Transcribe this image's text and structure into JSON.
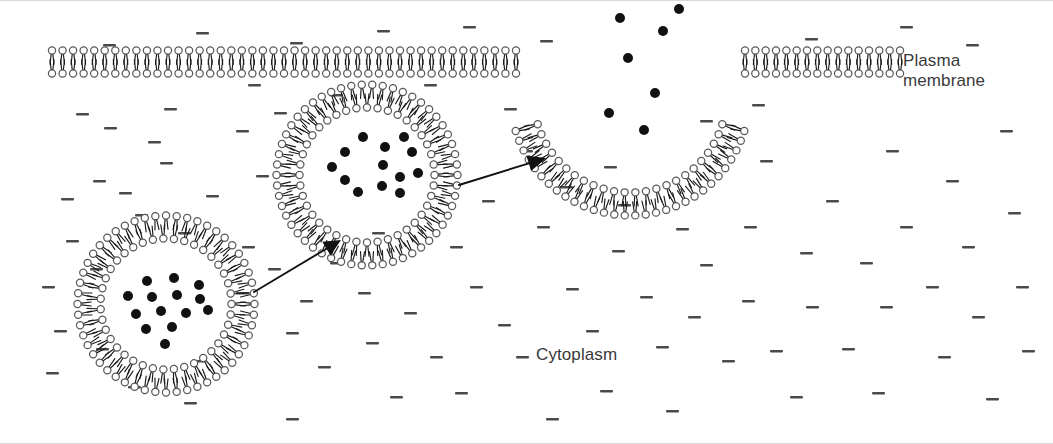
{
  "figure": {
    "type": "cell-biology-diagram",
    "width": 1053,
    "height": 444,
    "background_color": "#ffffff"
  },
  "labels": {
    "plasma_membrane": "Plasma\nmembrane",
    "cytoplasm": "Cytoplasm"
  },
  "colors": {
    "head_stroke": "#5a5a5a",
    "tail_stroke": "#1a1a1a",
    "cargo_fill": "#111111",
    "arrow_stroke": "#111111",
    "dash_fill": "#4a4a4a",
    "text": "#3a3a3a",
    "frame": "#d8d8d8"
  },
  "style": {
    "head_radius": 3.6,
    "head_stroke_width": 1.25,
    "tail_length": 9.5,
    "tail_stroke_width": 1.15,
    "tail_spread": 2.0,
    "lipid_spacing": 10.6,
    "bilayer_gap": 23.0,
    "cargo_radius": 5.0
  },
  "membrane_segments": [
    {
      "name": "plasma-membrane-left",
      "kind": "flat",
      "x1": 52,
      "x2": 516,
      "y": 62,
      "note": "intact bilayer left of the fusion site"
    },
    {
      "name": "plasma-membrane-right",
      "kind": "flat",
      "x1": 745,
      "x2": 900,
      "y": 62,
      "note": "intact bilayer right of the fusion site"
    }
  ],
  "fusion_pore": {
    "name": "fusion-pore",
    "center_x": 630,
    "center_y": 96,
    "radius": 108,
    "start_angle_deg": 163,
    "end_angle_deg": 17,
    "note": "open U-shaped pore continuous with the plasma membrane, releasing cargo"
  },
  "vesicles": [
    {
      "name": "vesicle-cytoplasmic",
      "stage": "free in cytoplasm",
      "center_x": 166,
      "center_y": 304,
      "radius": 77,
      "cargo": [
        {
          "x": 147,
          "y": 281
        },
        {
          "x": 174,
          "y": 278
        },
        {
          "x": 199,
          "y": 285
        },
        {
          "x": 128,
          "y": 296
        },
        {
          "x": 152,
          "y": 297
        },
        {
          "x": 177,
          "y": 295
        },
        {
          "x": 200,
          "y": 299
        },
        {
          "x": 136,
          "y": 314
        },
        {
          "x": 161,
          "y": 311
        },
        {
          "x": 186,
          "y": 313
        },
        {
          "x": 208,
          "y": 310
        },
        {
          "x": 146,
          "y": 329
        },
        {
          "x": 172,
          "y": 327
        },
        {
          "x": 165,
          "y": 344
        }
      ]
    },
    {
      "name": "vesicle-docking",
      "stage": "approaching the plasma membrane",
      "center_x": 367,
      "center_y": 175,
      "radius": 79,
      "cargo": [
        {
          "x": 363,
          "y": 137
        },
        {
          "x": 404,
          "y": 137
        },
        {
          "x": 345,
          "y": 152
        },
        {
          "x": 385,
          "y": 147
        },
        {
          "x": 412,
          "y": 152
        },
        {
          "x": 332,
          "y": 167
        },
        {
          "x": 383,
          "y": 165
        },
        {
          "x": 345,
          "y": 180
        },
        {
          "x": 400,
          "y": 177
        },
        {
          "x": 418,
          "y": 173
        },
        {
          "x": 382,
          "y": 186
        },
        {
          "x": 358,
          "y": 192
        },
        {
          "x": 400,
          "y": 193
        }
      ]
    }
  ],
  "released_cargo": [
    {
      "x": 620,
      "y": 18
    },
    {
      "x": 679,
      "y": 9
    },
    {
      "x": 663,
      "y": 31
    },
    {
      "x": 628,
      "y": 58
    },
    {
      "x": 655,
      "y": 93
    },
    {
      "x": 609,
      "y": 113
    },
    {
      "x": 644,
      "y": 130
    }
  ],
  "arrows": [
    {
      "name": "arrow-vesicle-to-dock",
      "x1": 254,
      "y1": 292,
      "x2": 341,
      "y2": 240,
      "head_length": 17,
      "head_width": 8
    },
    {
      "name": "arrow-dock-to-fusion",
      "x1": 459,
      "y1": 185,
      "x2": 546,
      "y2": 158,
      "head_length": 18,
      "head_width": 8
    }
  ],
  "cytoplasm_dashes": [
    {
      "x": 103,
      "y": 44
    },
    {
      "x": 196,
      "y": 32
    },
    {
      "x": 290,
      "y": 42
    },
    {
      "x": 377,
      "y": 30
    },
    {
      "x": 463,
      "y": 26
    },
    {
      "x": 540,
      "y": 40
    },
    {
      "x": 805,
      "y": 38
    },
    {
      "x": 900,
      "y": 26
    },
    {
      "x": 966,
      "y": 44
    },
    {
      "x": 76,
      "y": 113
    },
    {
      "x": 104,
      "y": 127
    },
    {
      "x": 148,
      "y": 141
    },
    {
      "x": 160,
      "y": 162
    },
    {
      "x": 93,
      "y": 180
    },
    {
      "x": 119,
      "y": 192
    },
    {
      "x": 61,
      "y": 198
    },
    {
      "x": 206,
      "y": 195
    },
    {
      "x": 236,
      "y": 130
    },
    {
      "x": 256,
      "y": 175
    },
    {
      "x": 274,
      "y": 112
    },
    {
      "x": 178,
      "y": 232
    },
    {
      "x": 135,
      "y": 214
    },
    {
      "x": 66,
      "y": 240
    },
    {
      "x": 42,
      "y": 286
    },
    {
      "x": 90,
      "y": 268
    },
    {
      "x": 54,
      "y": 330
    },
    {
      "x": 96,
      "y": 348
    },
    {
      "x": 46,
      "y": 372
    },
    {
      "x": 128,
      "y": 386
    },
    {
      "x": 192,
      "y": 360
    },
    {
      "x": 184,
      "y": 402
    },
    {
      "x": 242,
      "y": 246
    },
    {
      "x": 268,
      "y": 268
    },
    {
      "x": 236,
      "y": 292
    },
    {
      "x": 300,
      "y": 300
    },
    {
      "x": 286,
      "y": 332
    },
    {
      "x": 330,
      "y": 262
    },
    {
      "x": 358,
      "y": 292
    },
    {
      "x": 318,
      "y": 366
    },
    {
      "x": 366,
      "y": 342
    },
    {
      "x": 404,
      "y": 312
    },
    {
      "x": 430,
      "y": 356
    },
    {
      "x": 390,
      "y": 396
    },
    {
      "x": 286,
      "y": 418
    },
    {
      "x": 372,
      "y": 232
    },
    {
      "x": 450,
      "y": 246
    },
    {
      "x": 482,
      "y": 200
    },
    {
      "x": 470,
      "y": 286
    },
    {
      "x": 498,
      "y": 324
    },
    {
      "x": 455,
      "y": 392
    },
    {
      "x": 516,
      "y": 356
    },
    {
      "x": 520,
      "y": 150
    },
    {
      "x": 504,
      "y": 108
    },
    {
      "x": 537,
      "y": 226
    },
    {
      "x": 560,
      "y": 186
    },
    {
      "x": 566,
      "y": 288
    },
    {
      "x": 586,
      "y": 330
    },
    {
      "x": 546,
      "y": 418
    },
    {
      "x": 612,
      "y": 250
    },
    {
      "x": 600,
      "y": 390
    },
    {
      "x": 640,
      "y": 296
    },
    {
      "x": 656,
      "y": 346
    },
    {
      "x": 618,
      "y": 204
    },
    {
      "x": 676,
      "y": 228
    },
    {
      "x": 700,
      "y": 264
    },
    {
      "x": 688,
      "y": 316
    },
    {
      "x": 666,
      "y": 410
    },
    {
      "x": 722,
      "y": 360
    },
    {
      "x": 742,
      "y": 300
    },
    {
      "x": 744,
      "y": 226
    },
    {
      "x": 760,
      "y": 160
    },
    {
      "x": 770,
      "y": 350
    },
    {
      "x": 790,
      "y": 396
    },
    {
      "x": 800,
      "y": 252
    },
    {
      "x": 806,
      "y": 306
    },
    {
      "x": 826,
      "y": 200
    },
    {
      "x": 842,
      "y": 348
    },
    {
      "x": 860,
      "y": 262
    },
    {
      "x": 872,
      "y": 392
    },
    {
      "x": 880,
      "y": 306
    },
    {
      "x": 886,
      "y": 150
    },
    {
      "x": 900,
      "y": 226
    },
    {
      "x": 926,
      "y": 286
    },
    {
      "x": 938,
      "y": 356
    },
    {
      "x": 946,
      "y": 180
    },
    {
      "x": 962,
      "y": 246
    },
    {
      "x": 972,
      "y": 316
    },
    {
      "x": 986,
      "y": 398
    },
    {
      "x": 1000,
      "y": 130
    },
    {
      "x": 1008,
      "y": 212
    },
    {
      "x": 1016,
      "y": 286
    },
    {
      "x": 1022,
      "y": 350
    },
    {
      "x": 164,
      "y": 108
    },
    {
      "x": 330,
      "y": 94
    },
    {
      "x": 424,
      "y": 84
    },
    {
      "x": 248,
      "y": 84
    },
    {
      "x": 604,
      "y": 166
    },
    {
      "x": 700,
      "y": 120
    },
    {
      "x": 752,
      "y": 104
    }
  ]
}
